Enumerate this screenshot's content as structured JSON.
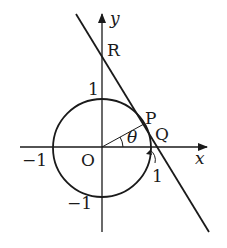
{
  "diagram": {
    "axes": {
      "x_label": "x",
      "y_label": "y",
      "origin_label": "O"
    },
    "ticks": {
      "x_neg": "−1",
      "y_pos": "1",
      "y_neg": "−1",
      "arc_label": "1"
    },
    "points": {
      "P": "P",
      "Q": "Q",
      "R": "R"
    },
    "angle_label": "θ",
    "colors": {
      "ink": "#1a1a1a",
      "background": "#ffffff"
    }
  }
}
